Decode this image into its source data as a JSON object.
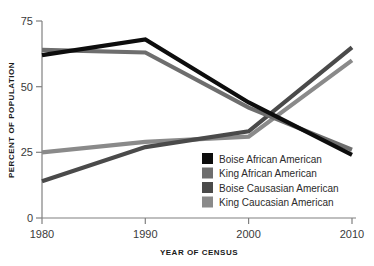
{
  "chart_data": {
    "type": "line",
    "title": "",
    "xlabel": "YEAR OF CENSUS",
    "ylabel": "PERCENT OF POPULATION",
    "x": [
      1980,
      1990,
      2000,
      2010
    ],
    "xtick_labels": [
      "1980",
      "1990",
      "2000",
      "2010"
    ],
    "ytick_labels": [
      "0",
      "25",
      "50",
      "75"
    ],
    "yticks": [
      0,
      25,
      50,
      75
    ],
    "xlim": [
      1980,
      2010
    ],
    "ylim": [
      0,
      75
    ],
    "grid": false,
    "legend_position": "center-right",
    "series": [
      {
        "name": "Boise African American",
        "color": "#0d0d0d",
        "values": [
          62,
          68,
          44,
          24
        ]
      },
      {
        "name": "King African American",
        "color": "#6e6e6e",
        "values": [
          64,
          63,
          42,
          26
        ]
      },
      {
        "name": "Boise Causasian American",
        "color": "#4a4a4a",
        "values": [
          14,
          27,
          33,
          65
        ]
      },
      {
        "name": "King Caucasian American",
        "color": "#8a8a8a",
        "values": [
          25,
          29,
          31,
          60
        ]
      }
    ]
  },
  "axis": {
    "y_ticks": [
      {
        "label": "75",
        "value": 75
      },
      {
        "label": "50",
        "value": 50
      },
      {
        "label": "25",
        "value": 25
      },
      {
        "label": "0",
        "value": 0
      }
    ],
    "x_ticks": [
      {
        "label": "1980",
        "value": 1980
      },
      {
        "label": "1990",
        "value": 1990
      },
      {
        "label": "2000",
        "value": 2000
      },
      {
        "label": "2010",
        "value": 2010
      }
    ],
    "x_title": "YEAR OF CENSUS",
    "y_title": "PERCENT OF POPULATION",
    "axis_color": "#808080"
  },
  "legend": {
    "entries": [
      {
        "label": "Boise African American",
        "color": "#0d0d0d"
      },
      {
        "label": "King African American",
        "color": "#6e6e6e"
      },
      {
        "label": "Boise Causasian American",
        "color": "#4a4a4a"
      },
      {
        "label": "King Caucasian American",
        "color": "#8a8a8a"
      }
    ]
  }
}
